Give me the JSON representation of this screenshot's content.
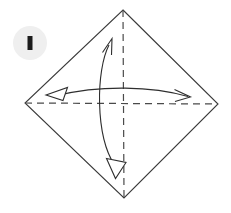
{
  "canvas": {
    "width": 231,
    "height": 213,
    "background": "#ffffff"
  },
  "step_badge": {
    "name": "step-marker",
    "shape": "circle",
    "label": "",
    "circle_fill": "#efefef",
    "mark_fill": "#1c1c1c",
    "center_x": 30,
    "center_y": 43,
    "radius": 17,
    "mark_width": 5,
    "mark_height": 14
  },
  "diagram": {
    "type": "origami-fold-instruction",
    "stroke_color": "#3a3a3a",
    "crease_color": "#4a4a4a",
    "arrow_color": "#2e2e2e",
    "shape": {
      "name": "square-paper-diamond-orientation",
      "vertices": [
        {
          "label": "top",
          "x": 123,
          "y": 10
        },
        {
          "label": "right",
          "x": 218,
          "y": 104
        },
        {
          "label": "bottom",
          "x": 124,
          "y": 198
        },
        {
          "label": "left",
          "x": 25,
          "y": 103
        }
      ]
    },
    "creases": [
      {
        "name": "horizontal-crease",
        "style": "dashed",
        "x1": 25,
        "y1": 103,
        "x2": 218,
        "y2": 104
      },
      {
        "name": "vertical-crease",
        "style": "dashed",
        "x1": 123,
        "y1": 10,
        "x2": 124,
        "y2": 198
      }
    ],
    "arrows": [
      {
        "name": "vertical-double-arrow",
        "direction": "bidirectional-vertical",
        "head_top": "barb",
        "head_bottom": "hollow-triangle",
        "bow": "left"
      },
      {
        "name": "horizontal-double-arrow",
        "direction": "bidirectional-horizontal",
        "head_left": "hollow-triangle",
        "head_right": "barb",
        "bow": "up"
      }
    ]
  }
}
